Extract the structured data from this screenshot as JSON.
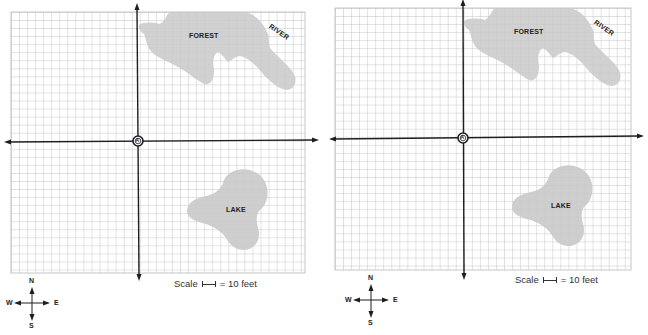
{
  "colors": {
    "grid_line": "#b9b9b9",
    "axis": "#1e1e1e",
    "feature_fill": "#c9c9c9",
    "text": "#222222"
  },
  "panels": [
    {
      "id": "left",
      "labels": {
        "forest": "FOREST",
        "river": "RIVER",
        "lake": "LAKE"
      },
      "origin_marker": "A",
      "scale": {
        "prefix": "Scale",
        "suffix": "= 10 feet"
      },
      "compass": {
        "north": "N",
        "south": "S",
        "east": "E",
        "west": "W"
      }
    },
    {
      "id": "right",
      "labels": {
        "forest": "FOREST",
        "river": "RIVER",
        "lake": "LAKE"
      },
      "origin_marker": "A",
      "scale": {
        "prefix": "Scale",
        "suffix": "= 10 feet"
      },
      "compass": {
        "north": "N",
        "south": "S",
        "east": "E",
        "west": "W"
      }
    }
  ]
}
